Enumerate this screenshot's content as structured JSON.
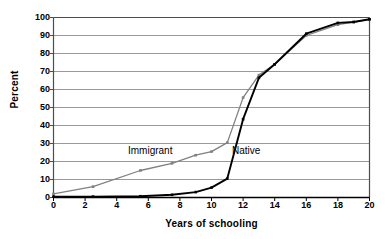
{
  "chart_data": {
    "type": "line",
    "title": "",
    "subtitle": "",
    "xlabel": "Years of schooling",
    "ylabel": "Percent",
    "xlim": [
      0,
      20
    ],
    "ylim": [
      0,
      100
    ],
    "xticks": [
      0,
      2,
      4,
      6,
      8,
      10,
      12,
      14,
      16,
      18,
      20
    ],
    "yticks": [
      0,
      10,
      20,
      30,
      40,
      50,
      60,
      70,
      80,
      90,
      100
    ],
    "grid": "horizontal",
    "legend": "inline-labels",
    "annotations": [
      {
        "text": "Immigrant",
        "x": 7.4,
        "y": 22
      },
      {
        "text": "Native",
        "x": 13.6,
        "y": 22
      }
    ],
    "series": [
      {
        "name": "Immigrant",
        "color": "#808080",
        "marker": "square",
        "x": [
          0,
          2.5,
          5.5,
          7.5,
          9,
          10,
          11,
          12,
          13,
          14,
          16,
          18,
          19,
          20
        ],
        "values": [
          2,
          6,
          15,
          19,
          23.5,
          25.5,
          30.5,
          55.5,
          68,
          74,
          90,
          96,
          97.5,
          99
        ]
      },
      {
        "name": "Native",
        "color": "#000000",
        "marker": "square",
        "x": [
          0,
          2.5,
          5.5,
          7.5,
          9,
          10,
          11,
          12,
          13,
          14,
          16,
          18,
          19,
          20
        ],
        "values": [
          0.5,
          0.5,
          0.7,
          1.5,
          3,
          5.5,
          10.5,
          43.5,
          66.5,
          74,
          91,
          97,
          97.5,
          99
        ]
      }
    ]
  },
  "axes": {
    "y_title": "Percent",
    "x_title": "Years of schooling",
    "y_tick_labels": [
      "100",
      "90",
      "80",
      "70",
      "60",
      "50",
      "40",
      "30",
      "20",
      "10",
      "0"
    ],
    "x_tick_labels": [
      "0",
      "2",
      "4",
      "6",
      "8",
      "10",
      "12",
      "14",
      "16",
      "18",
      "20"
    ]
  },
  "labels": {
    "immigrant": "Immigrant",
    "native": "Native"
  },
  "colors": {
    "immigrant_line": "#808080",
    "native_line": "#000000",
    "gridline": "#999999",
    "axis": "#4d4d4d",
    "background": "#ffffff"
  }
}
